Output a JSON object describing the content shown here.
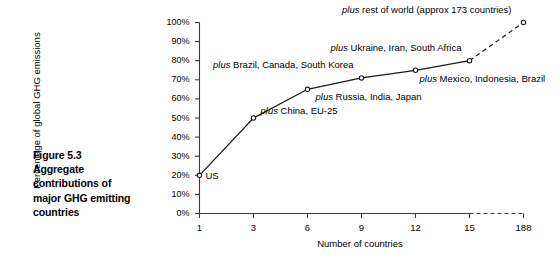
{
  "caption": {
    "figure_number": "Figure 5.3",
    "line1": "Aggregate",
    "line2": "contributions of",
    "line3": "major GHG emitting",
    "line4": "countries"
  },
  "chart_data": {
    "type": "line",
    "title": "",
    "xlabel": "Number of countries",
    "ylabel": "Percentage of global GHG emissions",
    "xtick_labels": [
      "1",
      "3",
      "6",
      "9",
      "12",
      "15",
      "188"
    ],
    "ytick_labels": [
      "0%",
      "10%",
      "20%",
      "30%",
      "40%",
      "50%",
      "60%",
      "70%",
      "80%",
      "90%",
      "100%"
    ],
    "ylim": [
      0,
      100
    ],
    "grid": false,
    "legend": "none",
    "axis_break": "between 15 and 188",
    "x": [
      1,
      3,
      6,
      9,
      12,
      15,
      188
    ],
    "values": [
      20,
      50,
      65,
      71,
      75,
      80,
      100
    ],
    "series": [
      {
        "name": "Cumulative share of global GHG emissions",
        "values": [
          20,
          50,
          65,
          71,
          75,
          80,
          100
        ]
      }
    ],
    "point_annotations": [
      {
        "x": 1,
        "y": 20,
        "emph": "",
        "text": "US"
      },
      {
        "x": 3,
        "y": 50,
        "emph": "plus",
        "text": " China, EU-25"
      },
      {
        "x": 6,
        "y": 65,
        "emph": "plus",
        "text": " Russia, India, Japan"
      },
      {
        "x": 9,
        "y": 71,
        "emph": "plus",
        "text": " Brazil, Canada, South Korea"
      },
      {
        "x": 12,
        "y": 75,
        "emph": "plus",
        "text": " Mexico, Indonesia, Brazil"
      },
      {
        "x": 15,
        "y": 80,
        "emph": "plus",
        "text": " Ukraine, Iran, South Africa"
      },
      {
        "x": 188,
        "y": 100,
        "emph": "plus",
        "text": " rest of world (approx 173 countries)"
      }
    ],
    "colors": {
      "line": "#1a1a1a",
      "marker_fill": "#ffffff",
      "marker_stroke": "#1a1a1a",
      "axis": "#3a3a3a",
      "text": "#000000",
      "background": "#ffffff"
    }
  }
}
